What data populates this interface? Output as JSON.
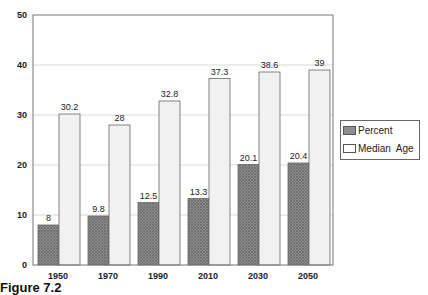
{
  "chart_data": {
    "type": "bar",
    "title": "",
    "xlabel": "",
    "ylabel": "",
    "categories": [
      "1950",
      "1970",
      "1990",
      "2010",
      "2030",
      "2050"
    ],
    "series": [
      {
        "name": "Percent",
        "values": [
          8,
          9.8,
          12.5,
          13.3,
          20.1,
          20.4
        ],
        "color": "#8a8a8a",
        "pattern": "crosshatch"
      },
      {
        "name": "Median  Age",
        "values": [
          30.2,
          28,
          32.8,
          37.3,
          38.6,
          39
        ],
        "color": "#f2f2f2"
      }
    ],
    "ylim": [
      0,
      50
    ],
    "yticks": [
      0,
      10,
      20,
      30,
      40,
      50
    ],
    "grid": true,
    "legend_position": "right",
    "data_labels": true
  },
  "caption": "Figure 7.2"
}
